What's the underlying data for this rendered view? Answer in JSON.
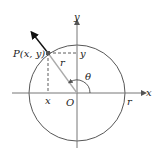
{
  "diagram": {
    "labels": {
      "point": "P(x, y)",
      "y_axis": "y",
      "x_axis": "x",
      "origin": "O",
      "radius": "r",
      "radius_on_axis": "r",
      "angle": "θ",
      "x_projection": "x",
      "y_projection": "y"
    },
    "colors": {
      "axis": "#555555",
      "circle": "#444444",
      "radius_line": "#aaaaaa",
      "arrow": "#111111",
      "dashed": "#333333",
      "point": "#555555"
    }
  }
}
